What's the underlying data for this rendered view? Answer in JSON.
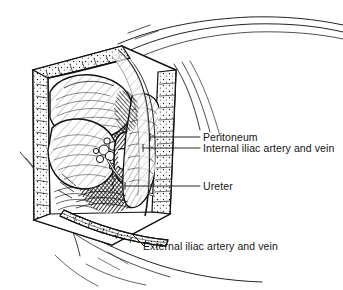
{
  "figure": {
    "kind": "anatomical-line-drawing",
    "style": "pen-and-ink cross-hatching, black on white",
    "background_color": "#ffffff",
    "ink_color": "#111111",
    "width_px": 343,
    "height_px": 290
  },
  "labels": [
    {
      "id": "peritoneum",
      "text": "Peritoneum",
      "leader": {
        "type": "horizontal",
        "x1": 150,
        "y1": 137,
        "x2": 200,
        "y2": 137,
        "tick": true
      }
    },
    {
      "id": "internal-iliac",
      "text": "Internal iliac artery and vein",
      "leader": {
        "type": "horizontal",
        "x1": 143,
        "y1": 148,
        "x2": 200,
        "y2": 148,
        "tick": true
      }
    },
    {
      "id": "ureter",
      "text": "Ureter",
      "leader": {
        "type": "horizontal",
        "x1": 125,
        "y1": 186,
        "x2": 200,
        "y2": 186,
        "tick": true
      }
    },
    {
      "id": "external-iliac",
      "text": "External iliac artery and vein",
      "leader": {
        "type": "diagonal",
        "x1": 131,
        "y1": 234,
        "x2": 143,
        "y2": 246,
        "tick": false
      }
    }
  ],
  "structures": [
    {
      "name": "abdominal-wall-retractor-frame",
      "description": "Trapezoidal wound edge framing the operative field"
    },
    {
      "name": "bowel-loop",
      "description": "Large smooth rounded viscus upper left of field"
    },
    {
      "name": "peritoneal-reflection",
      "description": "Translucent membrane sheet draped over the field"
    },
    {
      "name": "internal-iliac-vessels",
      "description": "Deep vessel bundle in center of exposure"
    },
    {
      "name": "ureter-cord",
      "description": "Slender tubular structure crossing the field"
    },
    {
      "name": "external-iliac-vessels",
      "description": "Vessel pair running along lower wound margin"
    },
    {
      "name": "surgical-drape-folds",
      "description": "Sweeping drape lines at lower left and upper right"
    }
  ]
}
